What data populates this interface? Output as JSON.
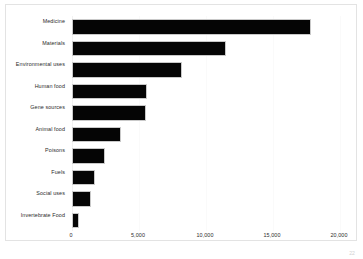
{
  "chart_data": {
    "type": "bar",
    "orientation": "horizontal",
    "title": "",
    "xlabel": "",
    "ylabel": "",
    "xlim": [
      0,
      20000
    ],
    "grid": true,
    "legend": null,
    "bar_color": "#050505",
    "bar_outline_color": "#c9c9c9",
    "xticks": [
      {
        "value": 0,
        "label": "0"
      },
      {
        "value": 5000,
        "label": "5,000"
      },
      {
        "value": 10000,
        "label": "10,000"
      },
      {
        "value": 15000,
        "label": "15,000"
      },
      {
        "value": 20000,
        "label": "20,000"
      }
    ],
    "categories": [
      "Medicine",
      "Materials",
      "Environmental uses",
      "Human food",
      "Gene sources",
      "Animal food",
      "Poisons",
      "Fuels",
      "Social uses",
      "Invertebrate Food"
    ],
    "values": [
      17800,
      11500,
      8200,
      5600,
      5500,
      3650,
      2450,
      1700,
      1400,
      550
    ]
  },
  "artifacts": {
    "page_number": "22"
  }
}
